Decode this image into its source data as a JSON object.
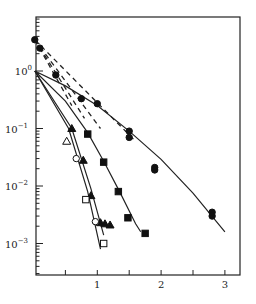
{
  "chart_data": {
    "type": "scatter",
    "title": "",
    "xlabel": "",
    "ylabel": "",
    "xscale": "linear",
    "yscale": "log",
    "xlim": [
      0.02,
      3.25
    ],
    "ylim": [
      0.0003,
      6.5
    ],
    "grid": false,
    "legend": "none",
    "x_ticks": [
      {
        "value": 0.5,
        "label": ""
      },
      {
        "value": 1,
        "label": "1"
      },
      {
        "value": 1.5,
        "label": ""
      },
      {
        "value": 2,
        "label": "2"
      },
      {
        "value": 2.5,
        "label": ""
      },
      {
        "value": 3,
        "label": "3"
      }
    ],
    "y_ticks": [
      {
        "value": 1,
        "label": "10",
        "exp": "0"
      },
      {
        "value": 0.1,
        "label": "10",
        "exp": "−1"
      },
      {
        "value": 0.01,
        "label": "10",
        "exp": "−2"
      },
      {
        "value": 0.001,
        "label": "10",
        "exp": "−3"
      }
    ],
    "series": [
      {
        "name": "filled-circles",
        "marker": "circle",
        "filled": true,
        "points": [
          [
            0.02,
            3.5
          ],
          [
            0.1,
            2.5
          ],
          [
            0.35,
            0.85
          ],
          [
            0.75,
            0.33
          ],
          [
            1.0,
            0.27
          ],
          [
            1.5,
            0.09
          ],
          [
            1.5,
            0.07
          ],
          [
            1.9,
            0.021
          ],
          [
            1.9,
            0.019
          ],
          [
            2.8,
            0.0035
          ],
          [
            2.8,
            0.003
          ]
        ],
        "fit": {
          "style": "solid",
          "points": [
            [
              0.02,
              1.0
            ],
            [
              0.5,
              0.55
            ],
            [
              1.0,
              0.25
            ],
            [
              1.5,
              0.09
            ],
            [
              2.0,
              0.029
            ],
            [
              2.5,
              0.0075
            ],
            [
              3.0,
              0.0016
            ]
          ]
        }
      },
      {
        "name": "filled-squares",
        "marker": "square",
        "filled": true,
        "points": [
          [
            0.85,
            0.08
          ],
          [
            1.1,
            0.026
          ],
          [
            1.33,
            0.008
          ],
          [
            1.48,
            0.0028
          ],
          [
            1.75,
            0.0015
          ]
        ],
        "fit": {
          "style": "solid",
          "points": [
            [
              0.02,
              1.0
            ],
            [
              0.5,
              0.3
            ],
            [
              0.85,
              0.085
            ],
            [
              1.1,
              0.027
            ],
            [
              1.35,
              0.008
            ],
            [
              1.6,
              0.0022
            ],
            [
              1.68,
              0.0016
            ]
          ]
        }
      },
      {
        "name": "filled-triangles",
        "marker": "triangle",
        "filled": true,
        "points": [
          [
            0.6,
            0.1
          ],
          [
            0.78,
            0.028
          ],
          [
            0.9,
            0.0068
          ],
          [
            1.05,
            0.0023
          ],
          [
            1.12,
            0.0022
          ],
          [
            1.2,
            0.0021
          ]
        ],
        "fit": {
          "style": "solid",
          "points": [
            [
              0.02,
              1.0
            ],
            [
              0.6,
              0.1
            ],
            [
              0.9,
              0.009
            ],
            [
              1.1,
              0.0014
            ]
          ]
        }
      },
      {
        "name": "open-triangles",
        "marker": "triangle",
        "filled": false,
        "points": [
          [
            0.52,
            0.06
          ]
        ],
        "fit": null
      },
      {
        "name": "open-circles",
        "marker": "circle",
        "filled": false,
        "points": [
          [
            0.67,
            0.03
          ],
          [
            0.97,
            0.0024
          ]
        ],
        "fit": {
          "style": "solid",
          "points": [
            [
              0.02,
              1.0
            ],
            [
              0.55,
              0.1
            ],
            [
              0.85,
              0.008
            ],
            [
              1.05,
              0.0008
            ]
          ]
        }
      },
      {
        "name": "open-squares",
        "marker": "square",
        "filled": false,
        "points": [
          [
            0.82,
            0.0058
          ],
          [
            1.1,
            0.001
          ]
        ],
        "fit": null
      }
    ],
    "dashed_lines": [
      {
        "points": [
          [
            0.02,
            3.5
          ],
          [
            1.6,
            0.06
          ]
        ]
      },
      {
        "points": [
          [
            0.02,
            3.5
          ],
          [
            1.05,
            0.1
          ]
        ]
      },
      {
        "points": [
          [
            0.02,
            3.5
          ],
          [
            0.8,
            0.15
          ]
        ]
      },
      {
        "points": [
          [
            0.02,
            3.5
          ],
          [
            0.6,
            0.25
          ]
        ]
      }
    ]
  }
}
